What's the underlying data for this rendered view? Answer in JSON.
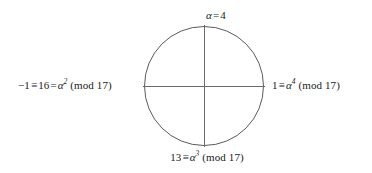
{
  "figure": {
    "kind": "modular-arithmetic-unit-circle",
    "stroke_color": "#5a5a5a",
    "axis_color": "#6b6b6b",
    "background_color": "#ffffff",
    "text_color": "#1a1a1a"
  },
  "labels": {
    "top": {
      "full_text": "α = 4",
      "symbol": "α",
      "relation": "=",
      "value": "4"
    },
    "right": {
      "full_text": "1 ≡ α⁴ (mod 17)",
      "value": "1",
      "relation": "≡",
      "symbol": "α",
      "exponent": "4",
      "modulus_text": "(mod 17)"
    },
    "bottom": {
      "full_text": "13 ≡ α³ (mod 17)",
      "value": "13",
      "relation": "≡",
      "symbol": "α",
      "exponent": "3",
      "modulus_text": "(mod 17)"
    },
    "left": {
      "full_text": "−1 ≡ 16 = α² (mod 17)",
      "value": "−1",
      "relation": "≡",
      "value_two": "16",
      "relation_two": "=",
      "symbol": "α",
      "exponent": "2",
      "modulus_text": "(mod 17)"
    }
  }
}
